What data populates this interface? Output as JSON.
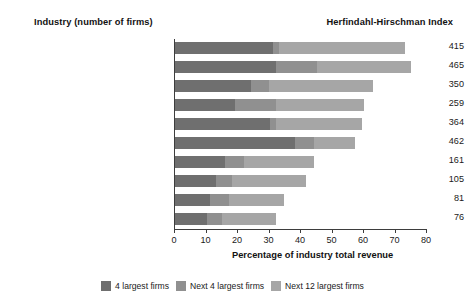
{
  "header": {
    "industry_title": "Industry (number of firms)",
    "index_title": "Herfindahl-Hirschman Index"
  },
  "chart_data": {
    "type": "bar",
    "orientation": "horizontal",
    "stacked": true,
    "title": "",
    "xlabel": "Percentage of industry total revenue",
    "ylabel": "",
    "xlim": [
      0,
      80
    ],
    "xticks": [
      0,
      10,
      20,
      30,
      40,
      50,
      60,
      70,
      80
    ],
    "grid": false,
    "legend_position": "bottom",
    "categories": [
      "Audio and video equipment  (521)",
      "Computers  (1,870)",
      "Frozen foods  (531)",
      "Canned foods  (661)",
      "Book printing  (690)",
      "Men's and boy's clothing  (1,362)",
      "Sporting goods  (2,477)",
      "Fish and seafood  (731)",
      "Jewelry  (2,278)",
      "Women's and girl's clothing  (2,927)"
    ],
    "series": [
      {
        "name": "4 largest firms",
        "color": "#6f6f6f",
        "values": [
          31,
          32,
          24,
          19,
          30,
          38,
          16,
          13,
          11,
          10
        ]
      },
      {
        "name": "Next 4 largest firms",
        "color": "#909090",
        "values": [
          2,
          13,
          6,
          13,
          2,
          6,
          6,
          5,
          6,
          5
        ]
      },
      {
        "name": "Next 12 largest firms",
        "color": "#a6a6a6",
        "values": [
          40,
          30,
          33,
          28,
          27.5,
          13,
          22,
          23.5,
          17.5,
          17
        ]
      }
    ],
    "cumulative_totals": [
      73,
      75,
      63,
      60,
      59.5,
      57,
      44,
      41.5,
      34.5,
      32
    ],
    "annotations": {
      "hhi_label": "Herfindahl-Hirschman Index",
      "hhi_values": [
        415,
        465,
        350,
        259,
        364,
        462,
        161,
        105,
        81,
        76
      ]
    }
  },
  "axis": {
    "tick_labels": [
      "0",
      "10",
      "20",
      "30",
      "40",
      "50",
      "60",
      "70",
      "80"
    ],
    "title": "Percentage of industry total revenue"
  },
  "legend": [
    {
      "label": "4 largest firms",
      "color": "#6f6f6f"
    },
    {
      "label": "Next 4 largest firms",
      "color": "#909090"
    },
    {
      "label": "Next 12 largest firms",
      "color": "#a6a6a6"
    }
  ]
}
